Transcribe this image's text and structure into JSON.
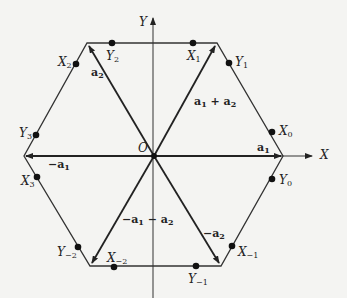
{
  "diagram": {
    "axes": {
      "x_label": "X",
      "y_label": "Y",
      "origin_label": "O"
    },
    "vectors": [
      {
        "id": "a1",
        "label": "a",
        "sub": "1"
      },
      {
        "id": "a2",
        "label": "a",
        "sub": "2"
      },
      {
        "id": "a1_plus_a2",
        "label": "a",
        "sub": "1",
        "rest": " + a",
        "rest_sub": "2"
      },
      {
        "id": "neg_a1",
        "label": "−a",
        "sub": "1"
      },
      {
        "id": "neg_a2",
        "label": "−a",
        "sub": "2"
      },
      {
        "id": "neg_a1_minus_a2",
        "label": "−a",
        "sub": "1",
        "rest": " − a",
        "rest_sub": "2"
      }
    ],
    "points": [
      {
        "id": "X0",
        "label": "X",
        "sub": "0"
      },
      {
        "id": "Y0",
        "label": "Y",
        "sub": "0"
      },
      {
        "id": "X1",
        "label": "X",
        "sub": "1"
      },
      {
        "id": "Y1",
        "label": "Y",
        "sub": "1"
      },
      {
        "id": "X2",
        "label": "X",
        "sub": "2"
      },
      {
        "id": "Y2",
        "label": "Y",
        "sub": "2"
      },
      {
        "id": "X3",
        "label": "X",
        "sub": "3"
      },
      {
        "id": "Y3",
        "label": "Y",
        "sub": "3"
      },
      {
        "id": "X-2",
        "label": "X",
        "sub": "−2"
      },
      {
        "id": "Y-2",
        "label": "Y",
        "sub": "−2"
      },
      {
        "id": "X-1",
        "label": "X",
        "sub": "−1"
      },
      {
        "id": "Y-1",
        "label": "Y",
        "sub": "−1"
      }
    ],
    "colors": {
      "line": "#222222",
      "background": "#f4f4f2"
    }
  }
}
